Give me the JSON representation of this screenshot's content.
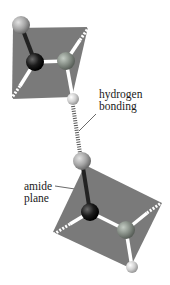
{
  "figure": {
    "labels": {
      "hydrogen_bonding": [
        "hydrogen",
        "bonding"
      ],
      "amide_plane": [
        "amide",
        "plane"
      ]
    },
    "colors": {
      "plane": "#7a7a7a",
      "carbon": "#1a1a1a",
      "oxygen": "#a8a8a8",
      "nitrogen": "#8c948c",
      "hydrogen": "#d8d8d8",
      "bond_white": "#ffffff",
      "hbond": "#555555"
    },
    "molecules": [
      {
        "name": "upper-amide",
        "plane": [
          [
            13,
            28
          ],
          [
            88,
            27
          ],
          [
            72,
            97
          ],
          [
            12,
            99
          ]
        ],
        "atoms": [
          {
            "type": "oxygen",
            "x": 21,
            "y": 25,
            "r": 9
          },
          {
            "type": "carbon",
            "x": 35,
            "y": 62,
            "r": 9
          },
          {
            "type": "nitrogen",
            "x": 66,
            "y": 61,
            "r": 9
          },
          {
            "type": "hydrogen",
            "x": 73,
            "y": 99,
            "r": 6
          }
        ]
      },
      {
        "name": "lower-amide",
        "plane": [
          [
            85,
            165
          ],
          [
            162,
            203
          ],
          [
            130,
            268
          ],
          [
            53,
            232
          ]
        ],
        "atoms": [
          {
            "type": "oxygen",
            "x": 82,
            "y": 161,
            "r": 9
          },
          {
            "type": "carbon",
            "x": 90,
            "y": 212,
            "r": 9
          },
          {
            "type": "nitrogen",
            "x": 126,
            "y": 230,
            "r": 9
          },
          {
            "type": "hydrogen",
            "x": 132,
            "y": 267,
            "r": 6
          }
        ]
      }
    ]
  }
}
